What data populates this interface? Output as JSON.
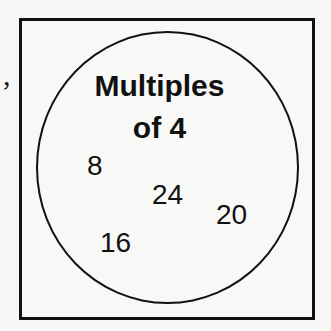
{
  "stray_mark": ",",
  "diagram": {
    "type": "venn-single-set",
    "set_label_line1": "Multiples",
    "set_label_line2": "of 4",
    "elements": [
      "8",
      "24",
      "20",
      "16"
    ]
  }
}
